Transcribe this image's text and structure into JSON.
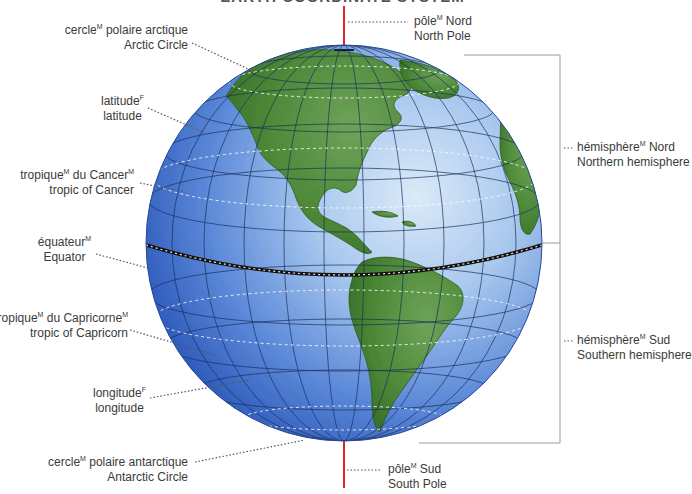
{
  "title": "EARTH COORDINATE SYSTEM",
  "colors": {
    "ocean_dark": "#2f5fc0",
    "ocean_light": "#c9def3",
    "land": "#4f8a3a",
    "land_edge": "#2f5e22",
    "grid": "#1b2e5a",
    "axis": "#e0242a",
    "leader": "#555555",
    "bracket": "#9a9a9a"
  },
  "labels": {
    "north_pole": {
      "fr": "pôle",
      "fr_gender": "M",
      "fr_rest": " Nord",
      "en": "North Pole"
    },
    "south_pole": {
      "fr": "pôle",
      "fr_gender": "M",
      "fr_rest": " Sud",
      "en": "South Pole"
    },
    "arctic_circle": {
      "fr": "cercle",
      "fr_gender": "M",
      "fr_rest": " polaire arctique",
      "en": "Arctic Circle"
    },
    "latitude": {
      "fr": "latitude",
      "fr_gender": "F",
      "fr_rest": "",
      "en": "latitude"
    },
    "tropic_cancer": {
      "fr": "tropique",
      "fr_gender": "M",
      "fr_mid": " du Cancer",
      "fr_gender2": "M",
      "en": "tropic of Cancer"
    },
    "equator": {
      "fr": "équateur",
      "fr_gender": "M",
      "fr_rest": "",
      "en": "Equator"
    },
    "tropic_capricorn": {
      "fr": "tropique",
      "fr_gender": "M",
      "fr_mid": " du Capricorne",
      "fr_gender2": "M",
      "en": "tropic of Capricorn"
    },
    "longitude": {
      "fr": "longitude",
      "fr_gender": "F",
      "fr_rest": "",
      "en": "longitude"
    },
    "antarctic_circle": {
      "fr": "cercle",
      "fr_gender": "M",
      "fr_rest": " polaire antarctique",
      "en": "Antarctic Circle"
    },
    "northern_hemisphere": {
      "fr": "hémisphère",
      "fr_gender": "M",
      "fr_rest": " Nord",
      "en": "Northern hemisphere"
    },
    "southern_hemisphere": {
      "fr": "hémisphère",
      "fr_gender": "M",
      "fr_rest": " Sud",
      "en": "Southern hemisphere"
    }
  }
}
